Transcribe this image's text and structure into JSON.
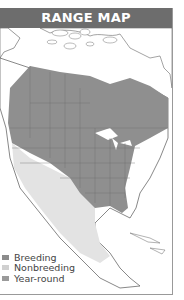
{
  "header": {
    "title": "RANGE MAP"
  },
  "legend": {
    "items": [
      {
        "label": "Breeding",
        "color": "#8c8c8c"
      },
      {
        "label": "Nonbreeding",
        "color": "#d0d0d0"
      },
      {
        "label": "Year-round",
        "color": "#9a9a9a"
      }
    ]
  },
  "colors": {
    "header_bg": "#6d6d6d",
    "yearround": "#8f8f8f",
    "nonbreeding": "#e3e3e3",
    "land": "#ffffff",
    "border": "#555555"
  }
}
